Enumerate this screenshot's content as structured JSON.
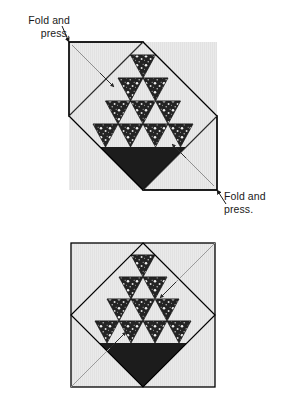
{
  "document": {
    "type": "quilting-instruction-diagram",
    "title": "Fold and press basket block diagram"
  },
  "colors": {
    "background_fabric": "#e9e9e9",
    "background_fabric_shade": "#dedede",
    "basket_dark": "#1c1c1c",
    "print_fabric_dark": "#232323",
    "print_fabric_speckle": "#f2f2f2",
    "outline": "#000000",
    "fold_line": "#3c3c3c",
    "leader_line": "#8a8a8a",
    "text": "#1a1a1a",
    "page": "#ffffff"
  },
  "callouts": [
    {
      "id": "callout-top-left",
      "line1": "Fold and",
      "line2": "press.",
      "points_to": "upper-block-top-left-fold-corner"
    },
    {
      "id": "callout-bottom-right",
      "line1": "Fold and",
      "line2": "press.",
      "points_to": "upper-block-bottom-right-fold-corner"
    }
  ],
  "figures": [
    {
      "id": "upper-figure",
      "state": "corners-folded",
      "description": "Block on point with top-left and bottom-right corners folded back and pressed",
      "folded_corners": [
        "top-left",
        "bottom-right"
      ],
      "has_leader_arrows": true
    },
    {
      "id": "lower-figure",
      "state": "square-unfolded",
      "description": "Completed square block with basket set on point, fold lines shown",
      "folded_corners": [],
      "has_leader_arrows": true
    }
  ],
  "block": {
    "name": "basket-block",
    "triangle_rows": [
      {
        "row": 1,
        "count": 1,
        "fabric": "print"
      },
      {
        "row": 2,
        "count": 2,
        "fabric": "print"
      },
      {
        "row": 3,
        "count": 3,
        "fabric": "print"
      },
      {
        "row": 4,
        "count": 4,
        "fabric": "print"
      }
    ],
    "basket_body": "solid-dark-inverted-triangle",
    "basket_feet": 2,
    "background": "light-solid"
  }
}
